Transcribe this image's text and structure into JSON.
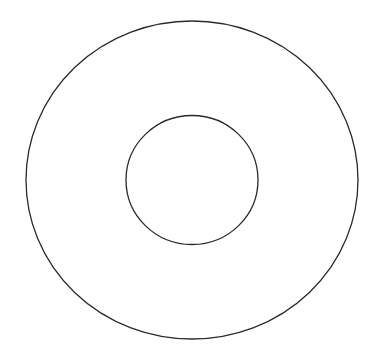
{
  "diagram": {
    "background": "#ffffff",
    "stroke_color": "#2a2a2a",
    "stroke_width": 1.3,
    "outer_circle": {
      "cx": 192,
      "cy": 180,
      "rx": 166,
      "ry": 159
    },
    "inner_circle": {
      "cx": 192,
      "cy": 180,
      "rx": 66,
      "ry": 64.5
    }
  }
}
